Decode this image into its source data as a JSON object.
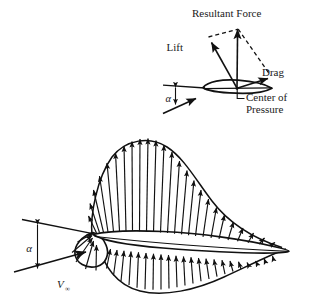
{
  "figure": {
    "background_color": "#ffffff",
    "line_color": "#111111"
  },
  "top_inset": {
    "name": "force-resolution-inset",
    "labels": {
      "resultant_force": "Resultant Force",
      "lift": "Lift",
      "drag": "Drag",
      "center_of_pressure_line1": "Center of",
      "center_of_pressure_line2": "Pressure",
      "angle_of_attack": "α"
    },
    "vectors": [
      {
        "name": "lift-vector",
        "label": "Lift",
        "direction": "up-left",
        "style": "solid"
      },
      {
        "name": "resultant-force-vector",
        "label": "Resultant Force",
        "direction": "up",
        "style": "solid"
      },
      {
        "name": "drag-vector",
        "label": "Drag",
        "direction": "right-down",
        "style": "solid"
      },
      {
        "name": "parallelogram-edge-lift",
        "label": "",
        "direction": "construction",
        "style": "dashed"
      },
      {
        "name": "parallelogram-edge-drag",
        "label": "",
        "direction": "construction",
        "style": "dashed"
      }
    ],
    "center_of_pressure_marker": "leader line to chord midpoint"
  },
  "main_diagram": {
    "name": "pressure-distribution-diagram",
    "labels": {
      "angle_of_attack": "α",
      "freestream_velocity": "V",
      "freestream_subscript": "∞"
    },
    "upper_surface": {
      "arrow_direction": "outward (away from surface, suction)",
      "arrow_count": 24,
      "description": "Pressure envelope peaks near the leading edge and tapers to the trailing edge"
    },
    "lower_surface": {
      "arrow_direction": "inward (toward surface, positive pressure)",
      "arrow_count": 24,
      "description": "Pressure envelope is fuller in the mid-chord region"
    },
    "leading_edge": {
      "arrow_direction": "inward (stagnation region)",
      "description": "Rounded nose with arrows pointing into the surface"
    }
  }
}
